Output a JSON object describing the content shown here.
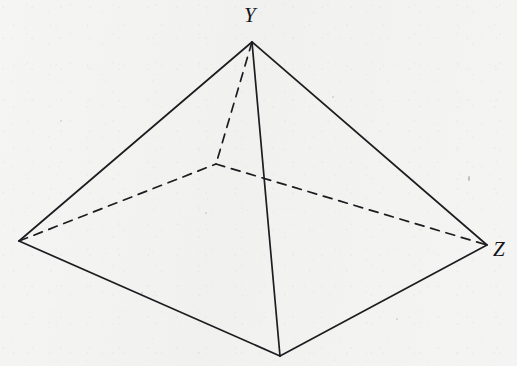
{
  "figure": {
    "kind": "geometry-diagram",
    "shape": "square-based pyramid",
    "background_color": "#f2f2f1",
    "stroke_color": "#1d1d21",
    "labels": [
      {
        "id": "Y",
        "text": "Y",
        "x": 253,
        "y": 16,
        "attached_vertex": "apex"
      },
      {
        "id": "Z",
        "text": "Z",
        "x": 502,
        "y": 250,
        "attached_vertex": "right"
      }
    ],
    "vertices": {
      "apex": {
        "name": "Y",
        "x": 252,
        "y": 42
      },
      "left": {
        "name": "",
        "x": 19,
        "y": 241
      },
      "front": {
        "name": "",
        "x": 280,
        "y": 356
      },
      "right": {
        "name": "Z",
        "x": 487,
        "y": 245
      },
      "back_hidden": {
        "name": "",
        "x": 216,
        "y": 164
      }
    },
    "solid_edges": [
      {
        "from": "apex",
        "to": "left"
      },
      {
        "from": "apex",
        "to": "right"
      },
      {
        "from": "apex",
        "to": "front"
      },
      {
        "from": "left",
        "to": "front"
      },
      {
        "from": "front",
        "to": "right"
      }
    ],
    "dashed_edges": [
      {
        "from": "apex",
        "to": "back_hidden"
      },
      {
        "from": "left",
        "to": "back_hidden"
      },
      {
        "from": "back_hidden",
        "to": "right"
      }
    ],
    "stroke_width": 1.7,
    "dash_pattern": "9 7"
  },
  "chart_data": {
    "type": "diagram",
    "title": "",
    "labeled_points": [
      "Y",
      "Z"
    ]
  }
}
